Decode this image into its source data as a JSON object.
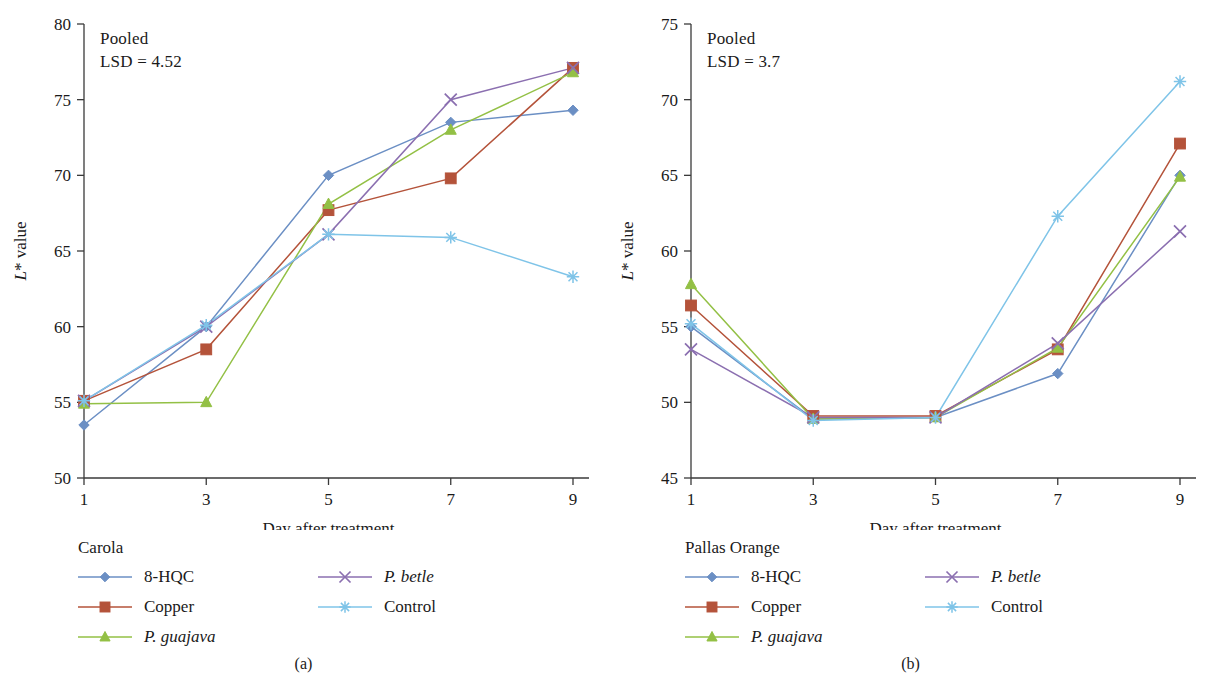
{
  "figure": {
    "panels": [
      {
        "id": "a",
        "subcaption": "(a)",
        "annotation_line1": "Pooled",
        "annotation_line2": "LSD = 4.52",
        "legend_title": "Carola",
        "chart_data": {
          "type": "line",
          "title": "Carola",
          "xlabel": "Day after treatment",
          "ylabel": "L* value",
          "x": [
            1,
            3,
            5,
            7,
            9
          ],
          "xticklabels": [
            "1",
            "3",
            "5",
            "7",
            "9"
          ],
          "xlim": [
            1,
            9
          ],
          "ylim": [
            50,
            80
          ],
          "yticks": [
            50,
            55,
            60,
            65,
            70,
            75,
            80
          ],
          "yticklabels": [
            "50",
            "55",
            "60",
            "65",
            "70",
            "75",
            "80"
          ],
          "grid": false,
          "legend_position": "below-left",
          "annotations": [
            "Pooled",
            "LSD = 4.52"
          ],
          "series": [
            {
              "name": "8-HQC",
              "marker": "diamond",
              "color": "#6b8fc4",
              "values": [
                53.5,
                60.0,
                70.0,
                73.5,
                74.3
              ]
            },
            {
              "name": "Copper",
              "marker": "square",
              "color": "#b4533a",
              "values": [
                55.1,
                58.5,
                67.7,
                69.8,
                77.1
              ]
            },
            {
              "name": "P. guajava",
              "marker": "triangle",
              "color": "#93c045",
              "values": [
                54.9,
                55.0,
                68.1,
                73.0,
                76.8
              ]
            },
            {
              "name": "P. betle",
              "marker": "x",
              "color": "#8b6fb0",
              "values": [
                55.1,
                60.0,
                66.1,
                75.0,
                77.1
              ]
            },
            {
              "name": "Control",
              "marker": "asterisk",
              "color": "#7fc4e8",
              "values": [
                55.1,
                60.1,
                66.1,
                65.9,
                63.3
              ]
            }
          ]
        },
        "legend_items": [
          {
            "label": "8-HQC",
            "italic": false,
            "marker": "diamond",
            "color": "#6b8fc4",
            "column": 1
          },
          {
            "label": "Copper",
            "italic": false,
            "marker": "square",
            "color": "#b4533a",
            "column": 1
          },
          {
            "label": "P. guajava",
            "italic": true,
            "marker": "triangle",
            "color": "#93c045",
            "column": 1
          },
          {
            "label": "P. betle",
            "italic": true,
            "marker": "x",
            "color": "#8b6fb0",
            "column": 2
          },
          {
            "label": "Control",
            "italic": false,
            "marker": "asterisk",
            "color": "#7fc4e8",
            "column": 2
          }
        ]
      },
      {
        "id": "b",
        "subcaption": "(b)",
        "annotation_line1": "Pooled",
        "annotation_line2": "LSD = 3.7",
        "legend_title": "Pallas Orange",
        "chart_data": {
          "type": "line",
          "title": "Pallas Orange",
          "xlabel": "Day after treatment",
          "ylabel": "L* value",
          "x": [
            1,
            3,
            5,
            7,
            9
          ],
          "xticklabels": [
            "1",
            "3",
            "5",
            "7",
            "9"
          ],
          "xlim": [
            1,
            9
          ],
          "ylim": [
            45,
            75
          ],
          "yticks": [
            45,
            50,
            55,
            60,
            65,
            70,
            75
          ],
          "yticklabels": [
            "45",
            "50",
            "55",
            "60",
            "65",
            "70",
            "75"
          ],
          "grid": false,
          "legend_position": "below-left",
          "annotations": [
            "Pooled",
            "LSD = 3.7"
          ],
          "series": [
            {
              "name": "8-HQC",
              "marker": "diamond",
              "color": "#6b8fc4",
              "values": [
                55.0,
                48.9,
                49.0,
                51.9,
                65.0
              ]
            },
            {
              "name": "Copper",
              "marker": "square",
              "color": "#b4533a",
              "values": [
                56.4,
                49.1,
                49.1,
                53.5,
                67.1
              ]
            },
            {
              "name": "P. guajava",
              "marker": "triangle",
              "color": "#93c045",
              "values": [
                57.8,
                48.9,
                49.0,
                53.6,
                64.9
              ]
            },
            {
              "name": "P. betle",
              "marker": "x",
              "color": "#8b6fb0",
              "values": [
                53.5,
                49.0,
                49.0,
                53.9,
                61.3
              ]
            },
            {
              "name": "Control",
              "marker": "asterisk",
              "color": "#7fc4e8",
              "values": [
                55.2,
                48.8,
                49.0,
                62.3,
                71.2
              ]
            }
          ]
        },
        "legend_items": [
          {
            "label": "8-HQC",
            "italic": false,
            "marker": "diamond",
            "color": "#6b8fc4",
            "column": 1
          },
          {
            "label": "Copper",
            "italic": false,
            "marker": "square",
            "color": "#b4533a",
            "column": 1
          },
          {
            "label": "P. guajava",
            "italic": true,
            "marker": "triangle",
            "color": "#93c045",
            "column": 1
          },
          {
            "label": "P. betle",
            "italic": true,
            "marker": "x",
            "color": "#8b6fb0",
            "column": 2
          },
          {
            "label": "Control",
            "italic": false,
            "marker": "asterisk",
            "color": "#7fc4e8",
            "column": 2
          }
        ]
      }
    ],
    "ylabel_prefix": "L",
    "ylabel_star": "*",
    "ylabel_suffix": " value"
  }
}
